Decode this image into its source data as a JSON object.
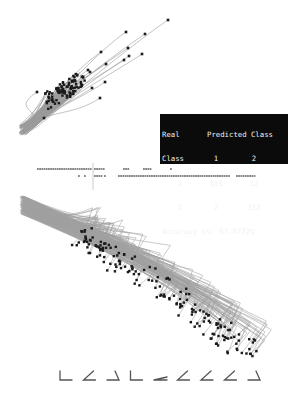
{
  "figure": {
    "colors": {
      "background": "#ffffff",
      "trajectory": "#9a9a9a",
      "point": "#1a1a1a",
      "table_bg": "#0b0b0b",
      "table_fg": "#f2f2f2",
      "glyph": "#555555"
    }
  },
  "confusion_matrix": {
    "header_left": "Real",
    "header_right": "Predicted Class",
    "class_label": "Class",
    "col_labels": [
      "1",
      "2"
    ],
    "rows": [
      {
        "label": "1",
        "values": [
          "313",
          "12"
        ]
      },
      {
        "label": "2",
        "values": [
          "2",
          "152"
        ]
      }
    ],
    "accuracy_text": "Accuracy is: 97.0772%"
  },
  "chart_data": [
    {
      "type": "scatter",
      "title": "",
      "description": "Upper panel: bundle of gray trajectories from lower-left origin rising to upper-right, ending in dark points",
      "xlabel": "",
      "ylabel": "",
      "origin": [
        22,
        135
      ],
      "endpoints": [
        [
          168,
          20
        ],
        [
          126,
          32
        ],
        [
          145,
          34
        ],
        [
          128,
          48
        ],
        [
          101,
          52
        ],
        [
          142,
          54
        ],
        [
          129,
          56
        ],
        [
          124,
          60
        ],
        [
          106,
          64
        ],
        [
          88,
          70
        ],
        [
          90,
          72
        ],
        [
          105,
          82
        ],
        [
          92,
          88
        ],
        [
          37,
          92
        ],
        [
          100,
          98
        ],
        [
          44,
          118
        ]
      ],
      "cluster_center": [
        65,
        90
      ],
      "cluster_count": 140
    },
    {
      "type": "scatter",
      "title": "",
      "description": "Middle strip: two rows of dot/dash markers with a vertical marker line",
      "rows": [
        {
          "y": 169,
          "segments": [
            [
              37,
              90
            ],
            [
              94,
              103
            ],
            [
              123,
              128
            ],
            [
              143,
              150
            ],
            [
              170,
              171
            ]
          ]
        },
        {
          "y": 176,
          "segments": [
            [
              78,
              79
            ],
            [
              84,
              85
            ],
            [
              94,
              101
            ],
            [
              104,
              105
            ],
            [
              118,
              228
            ],
            [
              236,
              254
            ]
          ]
        }
      ],
      "marker_x": 93
    },
    {
      "type": "scatter",
      "title": "",
      "description": "Lower panel: dense gray band descending from upper-left to lower-right with dark points and hooked trajectory tails",
      "xlabel": "",
      "ylabel": "",
      "origin": [
        20,
        196
      ],
      "band_end": [
        265,
        340
      ],
      "point_count": 170
    },
    {
      "type": "table",
      "description": "Bottom row of nine angular glyphs (shape-class prototypes)",
      "glyphs": [
        "L-right",
        "angle-open",
        "J-hook",
        "L-right",
        "flat-wedge",
        "angle-open",
        "angle-open",
        "angle-open",
        "J-hook"
      ]
    }
  ]
}
